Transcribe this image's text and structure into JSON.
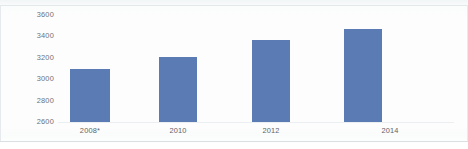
{
  "chart_data": {
    "type": "bar",
    "title": "",
    "subtitle": "",
    "xlabel": "",
    "ylabel": "",
    "categories": [
      "2008*",
      "2010",
      "2012",
      "2014"
    ],
    "values": [
      3100,
      3210,
      3370,
      3470
    ],
    "series": [
      {
        "name": "",
        "values": [
          3100,
          3210,
          3370,
          3470
        ]
      }
    ],
    "ylim": [
      2600,
      3600
    ],
    "yticks": [
      2600,
      2800,
      3000,
      3200,
      3400,
      3600
    ],
    "ytick_labels": [
      "2600",
      "2800",
      "3000",
      "3200",
      "3400",
      "3600"
    ],
    "xtick_labels": [
      "2008*",
      "2010",
      "2012",
      "2014"
    ],
    "grid": false,
    "legend": false,
    "legend_position": "none",
    "annotations": [],
    "colors": {
      "bar": "#5b7bb4",
      "background": "#fdfdfd",
      "axis_text": "#6d7276",
      "border": "#e3e8ea"
    }
  },
  "axis": {
    "y_ticks": [
      {
        "label": "3600",
        "value": 3600
      },
      {
        "label": "3400",
        "value": 3400
      },
      {
        "label": "3200",
        "value": 3200
      },
      {
        "label": "3000",
        "value": 3000
      },
      {
        "label": "2800",
        "value": 2800
      },
      {
        "label": "2600",
        "value": 2600
      }
    ],
    "x_ticks": [
      {
        "label": "2008*"
      },
      {
        "label": "2010"
      },
      {
        "label": "2012"
      },
      {
        "label": "2014"
      }
    ]
  }
}
